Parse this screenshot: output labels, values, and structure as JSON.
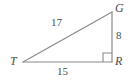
{
  "figure": {
    "type": "right-triangle-diagram",
    "background_color": "#ffffff",
    "line_color": "#8a8a8a",
    "text_color": "#4d4d4d",
    "vertices": [
      {
        "name": "T",
        "label": "T",
        "x": 23,
        "y": 62,
        "angle": "acute"
      },
      {
        "name": "G",
        "label": "G",
        "x": 112,
        "y": 12,
        "angle": "acute"
      },
      {
        "name": "R",
        "label": "R",
        "x": 112,
        "y": 62,
        "angle": "right"
      }
    ],
    "sides": [
      {
        "name": "hypotenuse-TG",
        "label": "17",
        "from": "T",
        "to": "G"
      },
      {
        "name": "leg-GR",
        "label": "8",
        "from": "G",
        "to": "R"
      },
      {
        "name": "leg-TR",
        "label": "15",
        "from": "T",
        "to": "R"
      }
    ],
    "right_angle_marker": {
      "at": "R",
      "size": 9
    }
  }
}
